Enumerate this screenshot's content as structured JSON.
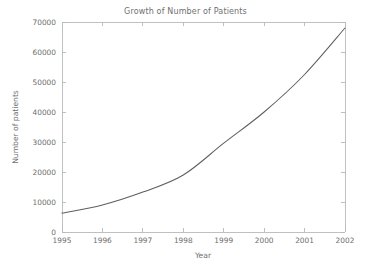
{
  "chart_data": {
    "type": "line",
    "title": "Growth of Number of Patients",
    "xlabel": "Year",
    "ylabel": "Number of patients",
    "x": [
      1995,
      1996,
      1997,
      1998,
      1999,
      2000,
      2001,
      2002
    ],
    "categories": [
      "1995",
      "1996",
      "1997",
      "1998",
      "1999",
      "2000",
      "2001",
      "2002"
    ],
    "values": [
      6300,
      9000,
      13300,
      19000,
      29600,
      40000,
      52500,
      68000
    ],
    "series": [
      {
        "name": "Number of patients",
        "values": [
          6300,
          9000,
          13300,
          19000,
          29600,
          40000,
          52500,
          68000
        ]
      }
    ],
    "xlim": [
      1995,
      2002
    ],
    "ylim": [
      0,
      70000
    ],
    "xticks": [
      1995,
      1996,
      1997,
      1998,
      1999,
      2000,
      2001,
      2002
    ],
    "xtick_labels": [
      "1995",
      "1996",
      "1997",
      "1998",
      "1999",
      "2000",
      "2001",
      "2002"
    ],
    "yticks": [
      0,
      10000,
      20000,
      30000,
      40000,
      50000,
      60000,
      70000
    ],
    "ytick_labels": [
      "0",
      "10000",
      "20000",
      "30000",
      "40000",
      "50000",
      "60000",
      "70000"
    ],
    "grid": false,
    "legend": false,
    "line_color": "#5f5f5f",
    "frame_color": "#b9b9b9",
    "text_color": "#6e6e6e",
    "background": "#ffffff"
  }
}
